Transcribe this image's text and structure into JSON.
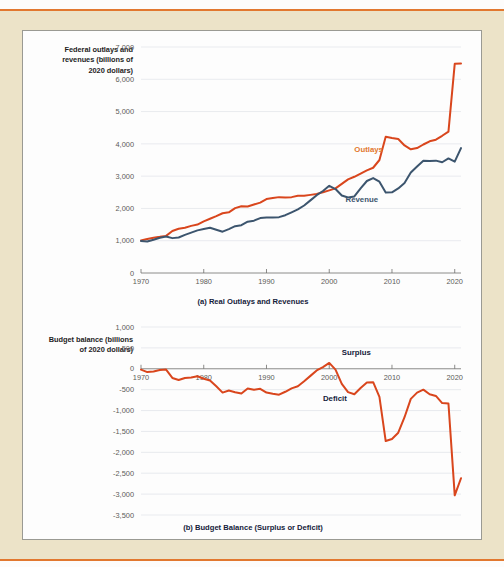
{
  "theme": {
    "page_background": "#ece3c8",
    "card_background": "#fdfdfd",
    "rule_color": "#e2782f",
    "outlays_color": "#d9461d",
    "revenue_color": "#3c556e",
    "outlays_label_color": "#e2782f",
    "grid_color": "#dfe3e8",
    "tick_text_color": "#5c5c58"
  },
  "panel_a": {
    "axis_title": "Federal outlays and revenues (billions of 2020 dollars)",
    "caption": "(a) Real Outlays and Revenues",
    "label_outlays": "Outlays",
    "label_revenue": "Revenue"
  },
  "panel_b": {
    "axis_title": "Budget balance (billions of 2020 dollars)",
    "caption": "(b) Budget Balance (Surplus or Deficit)",
    "label_surplus": "Surplus",
    "label_deficit": "Deficit"
  },
  "chart_data": [
    {
      "type": "line",
      "id": "panel-a",
      "title": "(a) Real Outlays and Revenues",
      "xlabel": "",
      "ylabel": "Federal outlays and revenues (billions of 2020 dollars)",
      "xlim": [
        1970,
        2021
      ],
      "ylim": [
        0,
        7000
      ],
      "yticks": [
        0,
        1000,
        2000,
        3000,
        4000,
        5000,
        6000,
        7000
      ],
      "ytick_labels": [
        "0",
        "1,000",
        "2,000",
        "3,000",
        "4,000",
        "5,000",
        "6,000",
        "7,000"
      ],
      "xticks": [
        1970,
        1980,
        1990,
        2000,
        2010,
        2020
      ],
      "xtick_labels": [
        "1970",
        "1980",
        "1990",
        "2000",
        "2010",
        "2020"
      ],
      "grid": true,
      "legend": "inline-annotations",
      "x": [
        1970,
        1971,
        1972,
        1973,
        1974,
        1975,
        1976,
        1977,
        1978,
        1979,
        1980,
        1981,
        1982,
        1983,
        1984,
        1985,
        1986,
        1987,
        1988,
        1989,
        1990,
        1991,
        1992,
        1993,
        1994,
        1995,
        1996,
        1997,
        1998,
        1999,
        2000,
        2001,
        2002,
        2003,
        2004,
        2005,
        2006,
        2007,
        2008,
        2009,
        2010,
        2011,
        2012,
        2013,
        2014,
        2015,
        2016,
        2017,
        2018,
        2019,
        2020,
        2021
      ],
      "series": [
        {
          "name": "Outlays",
          "color": "#d9461d",
          "values": [
            1010,
            1055,
            1095,
            1120,
            1150,
            1300,
            1370,
            1400,
            1460,
            1500,
            1600,
            1680,
            1760,
            1850,
            1880,
            2010,
            2070,
            2060,
            2120,
            2180,
            2290,
            2320,
            2350,
            2340,
            2350,
            2390,
            2390,
            2420,
            2450,
            2500,
            2560,
            2620,
            2760,
            2900,
            2980,
            3080,
            3180,
            3260,
            3500,
            4220,
            4180,
            4150,
            3950,
            3830,
            3870,
            3980,
            4080,
            4130,
            4250,
            4380,
            6480,
            6490
          ]
        },
        {
          "name": "Revenue",
          "color": "#3c556e",
          "values": [
            990,
            975,
            1030,
            1090,
            1130,
            1080,
            1100,
            1180,
            1250,
            1320,
            1360,
            1400,
            1340,
            1280,
            1360,
            1450,
            1480,
            1590,
            1620,
            1700,
            1720,
            1720,
            1730,
            1790,
            1880,
            1970,
            2090,
            2250,
            2410,
            2540,
            2700,
            2600,
            2400,
            2340,
            2370,
            2620,
            2850,
            2940,
            2830,
            2490,
            2500,
            2620,
            2790,
            3110,
            3300,
            3480,
            3470,
            3480,
            3430,
            3550,
            3450,
            3870
          ]
        }
      ]
    },
    {
      "type": "line",
      "id": "panel-b",
      "title": "(b) Budget Balance (Surplus or Deficit)",
      "xlabel": "",
      "ylabel": "Budget balance (billions of 2020 dollars)",
      "xlim": [
        1970,
        2021
      ],
      "ylim": [
        -3500,
        1000
      ],
      "yticks": [
        1000,
        500,
        0,
        -500,
        -1000,
        -1500,
        -2000,
        -2500,
        -3000,
        -3500
      ],
      "ytick_labels": [
        "1,000",
        "500",
        "0",
        "-500",
        "-1,000",
        "-1,500",
        "-2,000",
        "-2,500",
        "-3,000",
        "-3,500"
      ],
      "xticks": [
        1970,
        1980,
        1990,
        2000,
        2010,
        2020
      ],
      "xtick_labels": [
        "1970",
        "1980",
        "1990",
        "2000",
        "2010",
        "2020"
      ],
      "grid": true,
      "annotations": [
        {
          "text": "Surplus",
          "x": 2002,
          "y": 330
        },
        {
          "text": "Deficit",
          "x": 1999,
          "y": -760
        }
      ],
      "x": [
        1970,
        1971,
        1972,
        1973,
        1974,
        1975,
        1976,
        1977,
        1978,
        1979,
        1980,
        1981,
        1982,
        1983,
        1984,
        1985,
        1986,
        1987,
        1988,
        1989,
        1990,
        1991,
        1992,
        1993,
        1994,
        1995,
        1996,
        1997,
        1998,
        1999,
        2000,
        2001,
        2002,
        2003,
        2004,
        2005,
        2006,
        2007,
        2008,
        2009,
        2010,
        2011,
        2012,
        2013,
        2014,
        2015,
        2016,
        2017,
        2018,
        2019,
        2020,
        2021
      ],
      "series": [
        {
          "name": "Budget balance",
          "color": "#d9461d",
          "values": [
            -20,
            -80,
            -65,
            -30,
            -20,
            -220,
            -270,
            -220,
            -210,
            -180,
            -240,
            -280,
            -420,
            -570,
            -520,
            -560,
            -590,
            -470,
            -500,
            -480,
            -570,
            -600,
            -620,
            -550,
            -470,
            -420,
            -300,
            -170,
            -40,
            40,
            140,
            -20,
            -360,
            -560,
            -610,
            -460,
            -330,
            -320,
            -670,
            -1730,
            -1680,
            -1530,
            -1160,
            -720,
            -570,
            -500,
            -610,
            -650,
            -820,
            -830,
            -3030,
            -2620
          ]
        }
      ]
    }
  ]
}
